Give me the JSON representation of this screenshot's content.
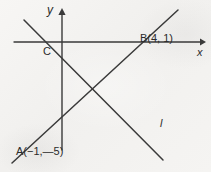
{
  "figure": {
    "kind": "coordinate-geometry-diagram",
    "background_color": "#f4f3f1",
    "ink_color": "#3a3a3a",
    "text_color": "#2b2b2b",
    "width": 211,
    "height": 172
  },
  "axes": {
    "origin": {
      "x": 62,
      "y": 42
    },
    "x_axis": {
      "label": "x",
      "start": {
        "x": 14,
        "y": 42
      },
      "end": {
        "x": 203,
        "y": 42
      },
      "arrow": "right"
    },
    "y_axis": {
      "label": "y",
      "start": {
        "x": 62,
        "y": 150
      },
      "end": {
        "x": 62,
        "y": 10
      },
      "arrow": "up"
    }
  },
  "points": [
    {
      "name": "C",
      "label": "C",
      "x": 48,
      "y": 53
    },
    {
      "name": "B",
      "label": "B(4, 1)",
      "x": 140,
      "y": 33,
      "coords": [
        4,
        1
      ]
    },
    {
      "name": "A",
      "label": "A(−1,—5)",
      "x": 16,
      "y": 146,
      "coords": [
        -1,
        -5
      ]
    }
  ],
  "lines": [
    {
      "name": "ascending-line-AB",
      "label": "",
      "start": {
        "x": 12,
        "y": 163
      },
      "end": {
        "x": 178,
        "y": 10
      }
    },
    {
      "name": "descending-line-l",
      "label": "l",
      "start": {
        "x": 24,
        "y": 20
      },
      "end": {
        "x": 163,
        "y": 160
      }
    }
  ],
  "line_label": {
    "text": "l",
    "x": 160,
    "y": 118
  }
}
